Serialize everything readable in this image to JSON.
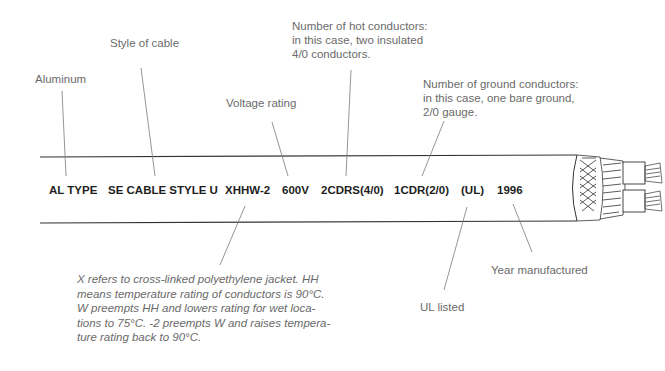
{
  "diagram": {
    "type": "labeled cable illustration",
    "labels": {
      "aluminum": "Aluminum",
      "style": "Style of cable",
      "voltage": "Voltage rating",
      "hot_conductors": "Number of hot conductors: in this case, two insulated 4/0 conductors.",
      "ground_conductors": "Number of ground conductors: in this case, one bare ground, 2/0 gauge.",
      "ul": "UL listed",
      "year": "Year manufactured",
      "xhhw_note": "X refers to cross-linked polyethylene jacket. HH means temperature rating of conductors is 90°C. W preempts HH and lowers rating for wet locations to 75°C. -2 preempts W and raises temperature rating back to 90°C."
    },
    "hot_lines": [
      "Number of hot conductors:",
      "in this case, two insulated",
      "4/0 conductors."
    ],
    "ground_lines": [
      "Number of ground conductors:",
      "in this case, one bare ground,",
      "2/0 gauge."
    ],
    "note_lines": [
      "X refers to cross-linked polyethylene jacket. HH",
      "means temperature rating of conductors is 90°C.",
      "W preempts HH and lowers rating for wet loca-",
      "tions to 75°C. -2 preempts W and raises tempera-",
      "ture rating back to 90°C."
    ],
    "cable_print": {
      "al_type": "AL TYPE",
      "se_cable": "SE CABLE STYLE U",
      "xhhw": "XHHW-2",
      "voltage": "600V",
      "hot": "2CDRS(4/0)",
      "ground": "1CDR(2/0)",
      "ul": "(UL)",
      "year": "1996"
    },
    "colors": {
      "label_text": "#6a6a6a",
      "print_text": "#1e1e1e",
      "line": "#555555"
    }
  }
}
